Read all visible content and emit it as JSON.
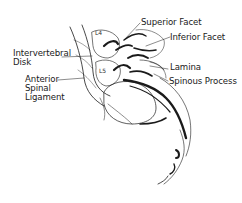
{
  "diagram": {
    "labels": {
      "superior_facet": "Superior Facet",
      "inferior_facet": "Inferior Facet",
      "intervertebral_disk_line1": "Intervertebral",
      "intervertebral_disk_line2": "Disk",
      "lamina": "Lamina",
      "spinous_process": "Spinous Process",
      "anterior_line1": "Anterior",
      "anterior_line2": "Spinal",
      "anterior_line3": "Ligament",
      "vertebra_l4": "L4",
      "vertebra_l5": "L5"
    },
    "colors": {
      "background": "#ffffff",
      "ink": "#1a1a1a"
    }
  }
}
